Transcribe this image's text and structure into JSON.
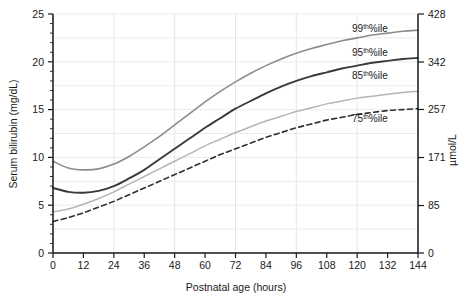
{
  "chart_data": {
    "type": "line",
    "title": "",
    "xlabel": "Postnatal age (hours)",
    "ylabel": "Serum bilirubin (mg/dL)",
    "y2label": "µmol/L",
    "xlim": [
      0,
      144
    ],
    "ylim": [
      0,
      25
    ],
    "y2lim": [
      0,
      428
    ],
    "grid": true,
    "legend_position": "inline-right",
    "xticks": [
      0,
      12,
      24,
      36,
      48,
      60,
      72,
      84,
      96,
      108,
      120,
      132,
      144
    ],
    "xtick_labels": [
      "0",
      "12",
      "24",
      "36",
      "48",
      "60",
      "72",
      "84",
      "96",
      "108",
      "120",
      "132",
      "144"
    ],
    "yticks": [
      0,
      5,
      10,
      15,
      20,
      25
    ],
    "ytick_labels": [
      "0",
      "5",
      "10",
      "15",
      "20",
      "25"
    ],
    "y2ticks": [
      0,
      85,
      171,
      257,
      342,
      428
    ],
    "y2tick_labels": [
      "0",
      "85",
      "171",
      "257",
      "342",
      "428"
    ],
    "x": [
      0,
      6,
      12,
      18,
      24,
      30,
      36,
      42,
      48,
      54,
      60,
      66,
      72,
      78,
      84,
      90,
      96,
      102,
      108,
      114,
      120,
      126,
      132,
      138,
      144
    ],
    "series": [
      {
        "name": "99th%ile",
        "label_base": "99",
        "label_sup": "th",
        "label_tail": "%ile",
        "color": "#8c8c8c",
        "width": 1.6,
        "dash": "none",
        "values": [
          9.6,
          8.9,
          8.7,
          8.8,
          9.3,
          10.1,
          11.1,
          12.2,
          13.4,
          14.6,
          15.8,
          16.9,
          17.9,
          18.8,
          19.6,
          20.3,
          20.9,
          21.4,
          21.8,
          22.2,
          22.5,
          22.8,
          23.0,
          23.2,
          23.3
        ]
      },
      {
        "name": "95th%ile",
        "label_base": "95",
        "label_sup": "th",
        "label_tail": "%ile",
        "color": "#3a3a3a",
        "width": 1.9,
        "dash": "none",
        "values": [
          6.8,
          6.4,
          6.3,
          6.5,
          7.0,
          7.8,
          8.7,
          9.8,
          10.9,
          12.0,
          13.1,
          14.1,
          15.1,
          15.9,
          16.7,
          17.4,
          18.0,
          18.5,
          18.9,
          19.3,
          19.6,
          19.9,
          20.1,
          20.3,
          20.4
        ]
      },
      {
        "name": "85th%ile",
        "label_base": "85",
        "label_sup": "th",
        "label_tail": "%ile",
        "color": "#b5b5b5",
        "width": 1.5,
        "dash": "none",
        "values": [
          4.3,
          4.6,
          5.1,
          5.7,
          6.4,
          7.2,
          8.0,
          8.8,
          9.6,
          10.4,
          11.2,
          11.9,
          12.6,
          13.2,
          13.8,
          14.3,
          14.8,
          15.2,
          15.6,
          15.9,
          16.2,
          16.4,
          16.6,
          16.8,
          16.9
        ]
      },
      {
        "name": "75th%ile",
        "label_base": "75",
        "label_sup": "th",
        "label_tail": "%ile",
        "color": "#2e2e2e",
        "width": 1.6,
        "dash": "5,3.5",
        "values": [
          3.3,
          3.7,
          4.2,
          4.8,
          5.4,
          6.1,
          6.8,
          7.5,
          8.2,
          8.9,
          9.6,
          10.3,
          10.9,
          11.5,
          12.1,
          12.6,
          13.1,
          13.5,
          13.9,
          14.2,
          14.5,
          14.7,
          14.9,
          15.0,
          15.1
        ]
      }
    ],
    "curve_labels": [
      {
        "base": "99",
        "sup": "th",
        "tail": "%ile",
        "x": 352,
        "y": 32
      },
      {
        "base": "95",
        "sup": "th",
        "tail": "%ile",
        "x": 352,
        "y": 56
      },
      {
        "base": "85",
        "sup": "th",
        "tail": "%ile",
        "x": 352,
        "y": 79
      },
      {
        "base": "75",
        "sup": "th",
        "tail": "%ile",
        "x": 352,
        "y": 122
      }
    ]
  },
  "footer": {
    "caption": ""
  }
}
